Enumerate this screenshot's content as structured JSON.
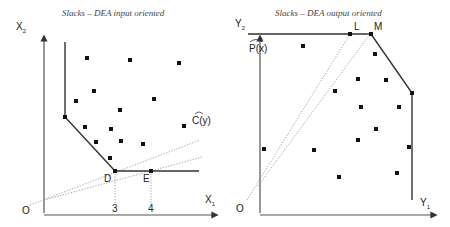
{
  "left_panel": {
    "title": "Slacks – DEA input oriented",
    "y_axis_label": "X",
    "y_axis_sub": "2",
    "x_axis_label": "X",
    "x_axis_sub": "1",
    "origin_label": "O",
    "frontier_label": "C(y)",
    "point_D": "D",
    "point_E": "E",
    "tick_3": "3",
    "tick_4": "4"
  },
  "right_panel": {
    "title": "Slacks – DEA output oriented",
    "y_axis_label": "Y",
    "y_axis_sub": "2",
    "x_axis_label": "Y",
    "x_axis_sub": "1",
    "origin_label": "O",
    "frontier_label": "P(x)",
    "point_L": "L",
    "point_M": "M"
  },
  "colors": {
    "axis": "#555555",
    "frontier": "#333333",
    "points": "#111111",
    "dotted": "#888888"
  }
}
